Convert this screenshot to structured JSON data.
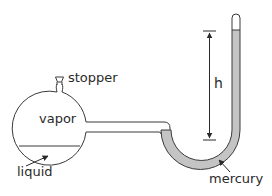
{
  "diagram": {
    "title": "",
    "labels": {
      "stopper": "stopper",
      "vapor": "vapor",
      "liquid": "liquid",
      "mercury": "mercury",
      "height": "h"
    },
    "components": [
      {
        "id": "flask",
        "description": "round-bottom flask containing vapor above liquid"
      },
      {
        "id": "stopper",
        "description": "stopper at top of flask neck"
      },
      {
        "id": "connecting-tube",
        "description": "horizontal tube from flask to manometer"
      },
      {
        "id": "manometer",
        "description": "closed-end U-tube partially filled with mercury"
      },
      {
        "id": "height-arrow",
        "description": "vertical double-headed dimension arrow labeled h"
      }
    ],
    "colors": {
      "outline": "#3a3a3a",
      "mercury": "#c4c4c4",
      "background": "#ffffff",
      "text": "#2a2a2a"
    }
  }
}
